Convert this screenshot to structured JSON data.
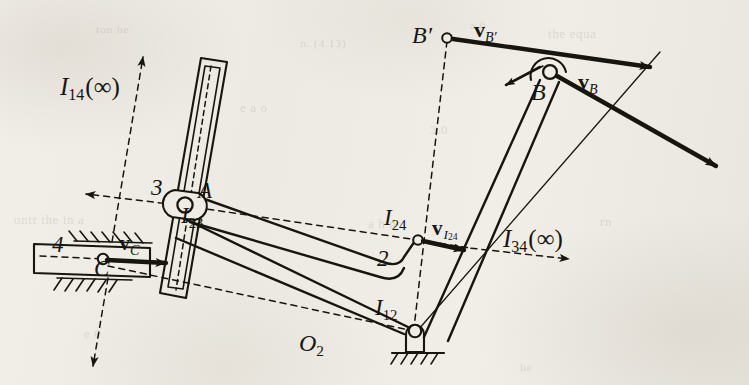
{
  "figure": {
    "kind": "kinematic-linkage-instant-centers-diagram",
    "background_hex": "#efece6",
    "ink_hex": "#17150f"
  },
  "ghost_text": [
    {
      "text": "the equa",
      "x": 548,
      "y": 26,
      "size": 13
    },
    {
      "text": "n.  (4.13)",
      "x": 300,
      "y": 36,
      "size": 12
    },
    {
      "text": "a   0",
      "x": 470,
      "y": 18,
      "size": 12
    },
    {
      "text": "ton he",
      "x": 96,
      "y": 22,
      "size": 12
    },
    {
      "text": "e  a  o",
      "x": 240,
      "y": 100,
      "size": 13
    },
    {
      "text": "ontr  the    in   a",
      "x": 14,
      "y": 212,
      "size": 13
    },
    {
      "text": "a  h      n",
      "x": 368,
      "y": 216,
      "size": 13
    },
    {
      "text": "rn",
      "x": 600,
      "y": 214,
      "size": 13
    },
    {
      "text": "3.0",
      "x": 430,
      "y": 122,
      "size": 13
    },
    {
      "text": "e 0",
      "x": 84,
      "y": 326,
      "size": 13
    },
    {
      "text": "he",
      "x": 520,
      "y": 360,
      "size": 12
    }
  ],
  "labels": {
    "i14": {
      "base": "I",
      "sub": "14",
      "tail": "(∞)",
      "x": 60,
      "y": 74
    },
    "i23": {
      "base": "I",
      "sub": "23",
      "x": 181,
      "y": 206
    },
    "i24": {
      "base": "I",
      "sub": "24",
      "x": 385,
      "y": 209
    },
    "i12": {
      "base": "I",
      "sub": "12",
      "x": 376,
      "y": 298
    },
    "i34": {
      "base": "I",
      "sub": "34",
      "tail": "(∞)",
      "x": 503,
      "y": 228
    },
    "o2": {
      "base": "O",
      "sub": "2",
      "x": 300,
      "y": 333
    },
    "point_a": {
      "text": "A",
      "x": 198,
      "y": 181
    },
    "point_b": {
      "text": "B",
      "x": 533,
      "y": 81
    },
    "point_bprime": {
      "text": "B′",
      "x": 414,
      "y": 25
    },
    "link2": {
      "text": "2",
      "x": 380,
      "y": 253
    },
    "link3": {
      "text": "3",
      "x": 154,
      "y": 178
    },
    "link4": {
      "text": "4",
      "x": 54,
      "y": 235
    },
    "vc": {
      "base": "v",
      "sub": "C",
      "x": 121,
      "y": 234
    },
    "vb": {
      "base": "v",
      "sub": "B",
      "x": 580,
      "y": 73
    },
    "vbprime": {
      "base": "v",
      "sub": "B′",
      "x": 476,
      "y": 21
    },
    "vi24": {
      "base": "v",
      "sub": "I",
      "sub2": "24",
      "x": 434,
      "y": 222
    }
  },
  "geometry": {
    "pivots": [
      {
        "name": "A-I23",
        "x": 186,
        "y": 206,
        "r": 7.5
      },
      {
        "name": "C",
        "x": 103,
        "y": 259,
        "r": 5.0
      },
      {
        "name": "I24",
        "x": 418,
        "y": 240,
        "r": 4.6
      },
      {
        "name": "I12",
        "x": 414,
        "y": 331,
        "r": 6.0
      },
      {
        "name": "B",
        "x": 550,
        "y": 72,
        "r": 6.8
      },
      {
        "name": "Bprime",
        "x": 447,
        "y": 38,
        "r": 4.6
      }
    ],
    "slot_link3": {
      "top_x": 214,
      "top_y": 62,
      "bot_x": 173,
      "bot_y": 294,
      "half_w": 13
    },
    "slider4": {
      "x": 34,
      "y": 243,
      "w": 100,
      "h": 32
    },
    "ground_i12": {
      "x": 414,
      "y": 331
    }
  }
}
